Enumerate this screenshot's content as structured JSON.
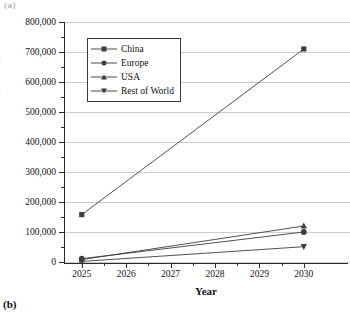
{
  "figure": {
    "panel_top_label": "(a)",
    "panel_bottom_label": "(b)"
  },
  "chart_data": {
    "type": "line",
    "title": "",
    "xlabel": "Year",
    "ylabel": "Future trend of truck stock (PHEV)",
    "x": [
      2025,
      2030
    ],
    "xlim": [
      2024.6,
      2030.5
    ],
    "ylim": [
      0,
      800000
    ],
    "ytick_labels": [
      "0",
      "100,000",
      "200,000",
      "300,000",
      "400,000",
      "500,000",
      "600,000",
      "700,000",
      "800,000"
    ],
    "ytick_values": [
      0,
      100000,
      200000,
      300000,
      400000,
      500000,
      600000,
      700000,
      800000
    ],
    "xtick_labels": [
      "2025",
      "2026",
      "2027",
      "2028",
      "2029",
      "2030"
    ],
    "xtick_values": [
      2025,
      2026,
      2027,
      2028,
      2029,
      2030
    ],
    "grid": "horizontal",
    "legend_position": "upper-left-inside",
    "series": [
      {
        "name": "China",
        "marker": "square",
        "values": [
          158000,
          710000
        ],
        "color": "#3d3d3d"
      },
      {
        "name": "Europe",
        "marker": "circle",
        "values": [
          11000,
          100000
        ],
        "color": "#3d3d3d"
      },
      {
        "name": "USA",
        "marker": "triangle-up",
        "values": [
          8000,
          120000
        ],
        "color": "#3d3d3d"
      },
      {
        "name": "Rest of World",
        "marker": "triangle-down",
        "values": [
          2000,
          51000
        ],
        "color": "#3d3d3d"
      }
    ]
  },
  "colors": {
    "axis": "#2a2a2a",
    "grid": "#cdcdcd",
    "series": "#3d3d3d",
    "background": "#ffffff"
  }
}
